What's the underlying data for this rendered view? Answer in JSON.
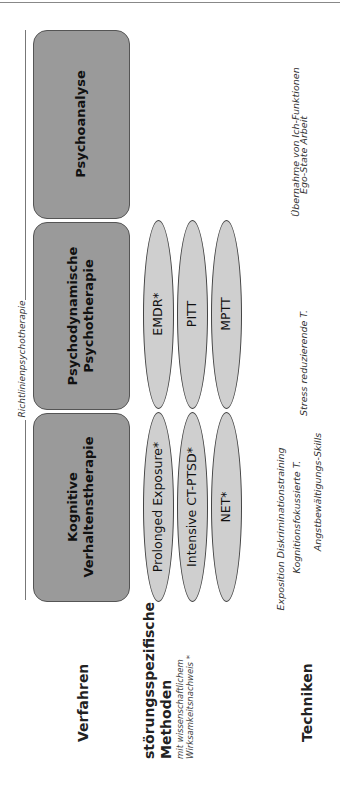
{
  "header_line": true,
  "bracket_label": "Richtlinienpsychotherapie",
  "verfahren": [
    {
      "label": "Psychoanalyse"
    },
    {
      "label": "Psychodynamische Psychotherapie"
    },
    {
      "label": "Kognitive Verhaltenstherapie"
    }
  ],
  "methoden": {
    "top_row": [
      "EMDR*",
      "PITT",
      "MPTT"
    ],
    "bottom_row": [
      "Prolonged Exposure*",
      "Intensive CT-PTSD*",
      "NET*"
    ]
  },
  "techniken": [
    "Übernahme von Ich-Funktionen",
    "Ego-State Arbeit",
    "Stress reduzierende T.",
    "Exposition Diskriminationstraining",
    "Kognitionsfokussierte T.",
    "Angstbewältigungs-Skills"
  ],
  "row_labels": {
    "verfahren": "Verfahren",
    "methoden_title_1": "störungsspezifische",
    "methoden_title_2": "Methoden",
    "methoden_sub_1": "mit wissenschaftlichem",
    "methoden_sub_2": "Wirksamkeitsnachweis *",
    "techniken": "Techniken"
  },
  "colors": {
    "box_fill": "#9a9a9a",
    "ellipse_fill": "#cfcfcf"
  }
}
